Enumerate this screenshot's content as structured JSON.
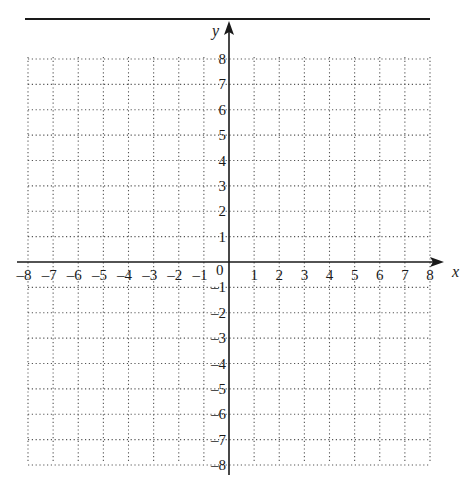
{
  "chart_data": {
    "type": "coordinate-grid",
    "title": "",
    "xlabel": "x",
    "ylabel": "y",
    "xlim": [
      -8,
      8
    ],
    "ylim": [
      -8,
      8
    ],
    "grid": true,
    "grid_style": "dotted",
    "x_ticks": [
      -8,
      -7,
      -6,
      -5,
      -4,
      -3,
      -2,
      -1,
      1,
      2,
      3,
      4,
      5,
      6,
      7,
      8
    ],
    "y_ticks": [
      8,
      7,
      6,
      5,
      4,
      3,
      2,
      1,
      -1,
      -2,
      -3,
      -4,
      -5,
      -6,
      -7,
      -8
    ],
    "x_tick_labels": [
      "–8",
      "–7",
      "–6",
      "–5",
      "–4",
      "–3",
      "–2",
      "–1",
      "1",
      "2",
      "3",
      "4",
      "5",
      "6",
      "7",
      "8"
    ],
    "y_tick_labels": [
      "8",
      "7",
      "6",
      "5",
      "4",
      "3",
      "2",
      "1",
      "–1",
      "–2",
      "–3",
      "–4",
      "–5",
      "–6",
      "–7",
      "–8"
    ],
    "origin_label": "0",
    "series": [],
    "legend": null
  },
  "colors": {
    "axis": "#1a1a1a",
    "grid": "#555555",
    "background": "#ffffff"
  }
}
